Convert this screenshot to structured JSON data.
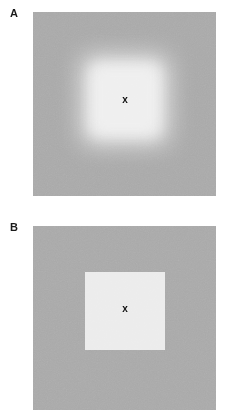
{
  "figure": {
    "background_color": "#ffffff",
    "width": 234,
    "height": 420,
    "panels": [
      {
        "letter": "A",
        "field_color": "#a9a9a9",
        "patch_color": "#ededed",
        "patch_edge": "blurred",
        "fixation_marker": "x"
      },
      {
        "letter": "B",
        "field_color": "#a9a9a9",
        "patch_color": "#ececec",
        "patch_edge": "sharp",
        "fixation_marker": "x"
      }
    ]
  },
  "colors": {
    "background": "#ffffff",
    "surround_gray": "#a9a9a9",
    "patch_light": "#ededed",
    "ink": "#111111"
  }
}
